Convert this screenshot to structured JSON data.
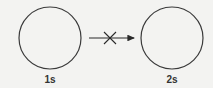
{
  "diagram": {
    "colors": {
      "stroke": "#3a3a3a",
      "background": "#f3f3f1"
    },
    "nodes": [
      {
        "id": "left",
        "label": "1s",
        "cx": 50,
        "cy": 38,
        "r": 31
      },
      {
        "id": "right",
        "label": "2s",
        "cx": 172,
        "cy": 38,
        "r": 31
      }
    ],
    "arrow": {
      "x1": 89,
      "y1": 38,
      "x2": 135,
      "y2": 38,
      "crossed": true,
      "cross_cx": 110,
      "cross_size": 6,
      "meaning": "transition forbidden"
    }
  }
}
